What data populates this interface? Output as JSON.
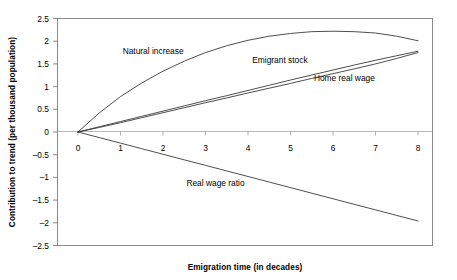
{
  "chart_data": {
    "type": "line",
    "title": "",
    "xlabel": "Emigration time (in decades)",
    "ylabel": "Contribution to trend (per thousand population)",
    "xlim": [
      0,
      8
    ],
    "ylim": [
      -2.5,
      2.5
    ],
    "x_ticks": [
      "0",
      "1",
      "2",
      "3",
      "4",
      "5",
      "6",
      "7",
      "8"
    ],
    "y_ticks": [
      "2.5",
      "2",
      "1.5",
      "1",
      "0.5",
      "0",
      "-0.5",
      "-1",
      "-1.5",
      "-2",
      "-2.5"
    ],
    "grid": false,
    "legend_position": "inline-annotations",
    "zero_line": true,
    "x": [
      0,
      0.5,
      1,
      1.5,
      2,
      2.5,
      3,
      3.5,
      4,
      4.5,
      5,
      5.5,
      6,
      6.5,
      7,
      7.5,
      8
    ],
    "series": [
      {
        "name": "Natural increase",
        "values": [
          0,
          0.42,
          0.78,
          1.08,
          1.34,
          1.56,
          1.75,
          1.9,
          2.02,
          2.11,
          2.17,
          2.21,
          2.22,
          2.21,
          2.18,
          2.11,
          2.01
        ],
        "label": "Natural increase",
        "label_x": 1.05,
        "label_y": 1.72
      },
      {
        "name": "Emigrant stock",
        "values": [
          0,
          0.115,
          0.23,
          0.345,
          0.46,
          0.575,
          0.69,
          0.8,
          0.915,
          1.03,
          1.145,
          1.255,
          1.365,
          1.475,
          1.58,
          1.68,
          1.78
        ],
        "label": "Emigrant stock",
        "label_x": 4.1,
        "label_y": 1.52
      },
      {
        "name": "Home real wage",
        "values": [
          0,
          0.1,
          0.205,
          0.315,
          0.425,
          0.535,
          0.645,
          0.75,
          0.86,
          0.965,
          1.07,
          1.18,
          1.285,
          1.39,
          1.5,
          1.62,
          1.75
        ],
        "label": "Home real wage",
        "label_x": 5.55,
        "label_y": 1.12
      },
      {
        "name": "Real wage ratio",
        "values": [
          0,
          -0.123,
          -0.245,
          -0.368,
          -0.49,
          -0.613,
          -0.735,
          -0.858,
          -0.98,
          -1.103,
          -1.225,
          -1.348,
          -1.47,
          -1.593,
          -1.715,
          -1.838,
          -1.96
        ],
        "label": "Real wage ratio",
        "label_x": 2.55,
        "label_y": -1.19
      }
    ]
  }
}
